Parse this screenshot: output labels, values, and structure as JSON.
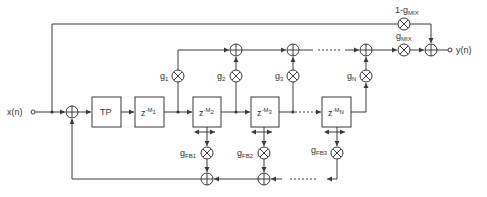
{
  "diagram": {
    "input_label": "x(n)",
    "output_label": "y(n)",
    "lowpass_label": "TP",
    "delays": [
      {
        "base": "z",
        "exp": "-M",
        "sub": "1"
      },
      {
        "base": "z",
        "exp": "-M",
        "sub": "2"
      },
      {
        "base": "z",
        "exp": "-M",
        "sub": "3"
      },
      {
        "base": "z",
        "exp": "-M",
        "sub": "N"
      }
    ],
    "tap_gains": [
      {
        "base": "g",
        "sub": "1"
      },
      {
        "base": "g",
        "sub": "2"
      },
      {
        "base": "g",
        "sub": "3"
      },
      {
        "base": "g",
        "sub": "N"
      }
    ],
    "feedback_gains": [
      {
        "base": "g",
        "sub": "FB1"
      },
      {
        "base": "g",
        "sub": "FB2"
      },
      {
        "base": "g",
        "sub": "FB3"
      }
    ],
    "mix_gain": {
      "base": "g",
      "sub": "MIX"
    },
    "dry_gain": {
      "prefix": "1-",
      "base": "g",
      "sub": "MIX"
    },
    "colors": {
      "line": "#3a3a3a",
      "text": "#333333",
      "background": "#ffffff"
    }
  }
}
